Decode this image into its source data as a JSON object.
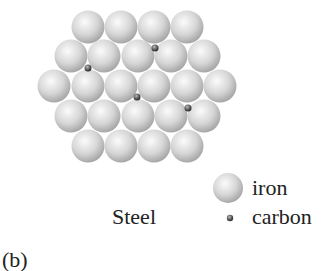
{
  "diagram": {
    "label_material": "Steel",
    "panel_label": "(b)",
    "legend": {
      "iron_label": "iron",
      "carbon_label": "carbon"
    },
    "iron_radius": 16.5,
    "carbon_radius": 3.5,
    "iron_atoms": [
      [
        88,
        27
      ],
      [
        121,
        27
      ],
      [
        154,
        27
      ],
      [
        187,
        27
      ],
      [
        71,
        56
      ],
      [
        104,
        56
      ],
      [
        138,
        56
      ],
      [
        171,
        56
      ],
      [
        204,
        56
      ],
      [
        54,
        86
      ],
      [
        88,
        86
      ],
      [
        121,
        86
      ],
      [
        154,
        86
      ],
      [
        187,
        86
      ],
      [
        220,
        86
      ],
      [
        71,
        116
      ],
      [
        104,
        116
      ],
      [
        138,
        116
      ],
      [
        171,
        116
      ],
      [
        204,
        116
      ],
      [
        88,
        146
      ],
      [
        121,
        146
      ],
      [
        154,
        146
      ],
      [
        187,
        146
      ]
    ],
    "carbon_atoms": [
      [
        155,
        48
      ],
      [
        88,
        68
      ],
      [
        137,
        97
      ],
      [
        188,
        108
      ]
    ],
    "colors": {
      "iron_light": "#f4f4f4",
      "iron_dark": "#a9a9a9",
      "carbon": "#555555",
      "text": "#222222"
    }
  }
}
